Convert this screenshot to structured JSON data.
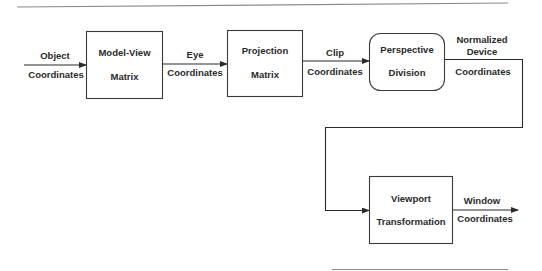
{
  "diagram": {
    "colors": {
      "stroke": "#3a3a3a",
      "text": "#2a2a2a",
      "rule": "#8a8a8a",
      "background": "#ffffff"
    },
    "stages": [
      {
        "id": "model-view",
        "line1": "Model-View",
        "line2": "Matrix",
        "shape": "rect"
      },
      {
        "id": "projection",
        "line1": "Projection",
        "line2": "Matrix",
        "shape": "rect"
      },
      {
        "id": "perspective-division",
        "line1": "Perspective",
        "line2": "Division",
        "shape": "rounded-rect"
      },
      {
        "id": "viewport",
        "line1": "Viewport",
        "line2": "Transformation",
        "shape": "rect"
      }
    ],
    "edges": [
      {
        "id": "object-coords",
        "top": "Object",
        "bottom": "Coordinates"
      },
      {
        "id": "eye-coords",
        "top": "Eye",
        "bottom": "Coordinates"
      },
      {
        "id": "clip-coords",
        "top": "Clip",
        "bottom": "Coordinates"
      },
      {
        "id": "ndc",
        "top1": "Normalized",
        "top2": "Device",
        "bottom": "Coordinates"
      },
      {
        "id": "window-coords",
        "top": "Window",
        "bottom": "Coordinates"
      }
    ]
  }
}
